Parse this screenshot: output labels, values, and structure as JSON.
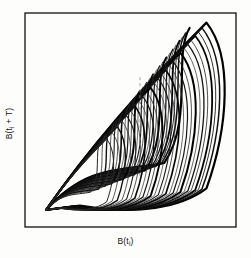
{
  "figure": {
    "title": "",
    "type": "phase-portrait",
    "axes": {
      "xlabel_main": "B(t",
      "xlabel_sub": "i",
      "xlabel_tail": ")",
      "ylabel_main": "B(t",
      "ylabel_sub": "i",
      "ylabel_tail": " + T)",
      "xlabel_full": "B(t i )",
      "ylabel_full": "B(t i + T)"
    },
    "frame": {
      "color": "#222222",
      "left": 25,
      "top": 13,
      "right": 236,
      "bottom": 227,
      "line_width": 1.4,
      "grid": false,
      "ticks": false
    },
    "style": {
      "background": "#fdfdfc",
      "trajectory_color": "#101010",
      "section_line_color": "#8a8a8a",
      "section_line_dash": "3 3"
    }
  },
  "chart_data": {
    "type": "line",
    "title": "",
    "xlabel": "B(t_i)",
    "ylabel": "B(t_i + T)",
    "grid": false,
    "legend": null,
    "xlim": [
      0,
      1
    ],
    "ylim": [
      0,
      1
    ],
    "n_bands": 26,
    "cusp_point": [
      0.1,
      0.08
    ],
    "fold_point": [
      0.88,
      0.96
    ],
    "lacuna_center": [
      0.62,
      0.66
    ],
    "poincare_section": {
      "x": 0.545,
      "y_start": 0.22,
      "y_end": 0.7,
      "dashed": true
    },
    "series": [
      {
        "name": "band-01",
        "scale": 1.0,
        "weight": 2.2,
        "shade": "#000000"
      },
      {
        "name": "band-02",
        "scale": 0.972,
        "weight": 1.5,
        "shade": "#101010"
      },
      {
        "name": "band-03",
        "scale": 0.95,
        "weight": 0.9,
        "shade": "#1a1a1a"
      },
      {
        "name": "band-04",
        "scale": 0.93,
        "weight": 1.8,
        "shade": "#050505"
      },
      {
        "name": "band-05",
        "scale": 0.905,
        "weight": 0.8,
        "shade": "#222222"
      },
      {
        "name": "band-06",
        "scale": 0.884,
        "weight": 1.3,
        "shade": "#121212"
      },
      {
        "name": "band-07",
        "scale": 0.862,
        "weight": 0.7,
        "shade": "#2a2a2a"
      },
      {
        "name": "band-08",
        "scale": 0.838,
        "weight": 2.0,
        "shade": "#000000"
      },
      {
        "name": "band-09",
        "scale": 0.814,
        "weight": 0.8,
        "shade": "#242424"
      },
      {
        "name": "band-10",
        "scale": 0.792,
        "weight": 1.2,
        "shade": "#141414"
      },
      {
        "name": "band-11",
        "scale": 0.77,
        "weight": 0.7,
        "shade": "#2c2c2c"
      },
      {
        "name": "band-12",
        "scale": 0.746,
        "weight": 1.7,
        "shade": "#080808"
      },
      {
        "name": "band-13",
        "scale": 0.722,
        "weight": 0.8,
        "shade": "#262626"
      },
      {
        "name": "band-14",
        "scale": 0.7,
        "weight": 1.1,
        "shade": "#181818"
      },
      {
        "name": "band-15",
        "scale": 0.676,
        "weight": 0.7,
        "shade": "#2e2e2e"
      },
      {
        "name": "band-16",
        "scale": 0.652,
        "weight": 1.9,
        "shade": "#030303"
      },
      {
        "name": "band-17",
        "scale": 0.628,
        "weight": 0.8,
        "shade": "#282828"
      },
      {
        "name": "band-18",
        "scale": 0.604,
        "weight": 1.2,
        "shade": "#161616"
      },
      {
        "name": "band-19",
        "scale": 0.58,
        "weight": 0.7,
        "shade": "#303030"
      },
      {
        "name": "band-20",
        "scale": 0.554,
        "weight": 1.6,
        "shade": "#0a0a0a"
      },
      {
        "name": "band-21",
        "scale": 0.528,
        "weight": 0.8,
        "shade": "#2a2a2a"
      },
      {
        "name": "band-22",
        "scale": 0.502,
        "weight": 1.1,
        "shade": "#1c1c1c"
      },
      {
        "name": "band-23",
        "scale": 0.474,
        "weight": 0.8,
        "shade": "#323232"
      },
      {
        "name": "band-24",
        "scale": 0.444,
        "weight": 1.4,
        "shade": "#121212"
      },
      {
        "name": "band-25",
        "scale": 0.412,
        "weight": 0.8,
        "shade": "#2e2e2e"
      },
      {
        "name": "band-26",
        "scale": 0.378,
        "weight": 1.0,
        "shade": "#242424"
      }
    ]
  }
}
